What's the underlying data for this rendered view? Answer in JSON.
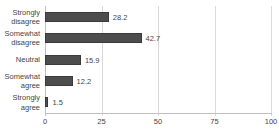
{
  "chart_data": {
    "type": "bar",
    "orientation": "horizontal",
    "title": "",
    "xlabel": "",
    "ylabel": "",
    "categories": [
      "Strongly disagree",
      "Somewhat disagree",
      "Neutral",
      "Somewhat agree",
      "Strongly agree"
    ],
    "values": [
      28.2,
      42.7,
      15.9,
      12.2,
      1.5
    ],
    "value_labels": [
      "28.2",
      "42.7",
      "15.9",
      "12.2",
      "1.5"
    ],
    "xlim": [
      0,
      100
    ],
    "xticks": [
      0,
      25,
      50,
      75,
      100
    ],
    "grid": "vertical-gridlines",
    "legend": "none",
    "colors": {
      "bar": "#4d4d4d",
      "bar_border": "#3a3a3a",
      "gridline": "#d9d9d9",
      "axis_line": "#bfbfbf",
      "text": "#454545",
      "background": "#ffffff"
    }
  }
}
